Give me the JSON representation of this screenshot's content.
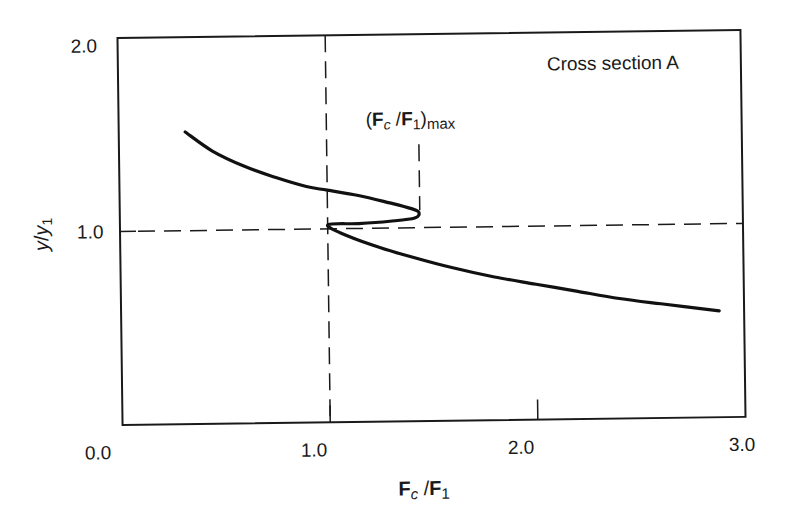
{
  "chart_data": {
    "type": "line",
    "title": "",
    "annotation_box": "Cross section A",
    "xlabel": "Fc/F1",
    "ylabel": "y/y1",
    "xlim": [
      0.0,
      3.0
    ],
    "ylim": [
      0.0,
      2.0
    ],
    "xticks": [
      "0.0",
      "1.0",
      "2.0",
      "3.0"
    ],
    "yticks": [
      "0.0",
      "1.0",
      "2.0"
    ],
    "grid": false,
    "legend": null,
    "reference_lines": [
      {
        "orientation": "vertical",
        "x": 1.0,
        "style": "dashed"
      },
      {
        "orientation": "horizontal",
        "y": 1.0,
        "style": "dashed"
      },
      {
        "orientation": "vertical",
        "x": 1.44,
        "y_from": 1.08,
        "y_to": 1.42,
        "style": "dashed",
        "label": "(Fc/F1)max"
      }
    ],
    "annotations": [
      {
        "text": "(Fc/F1)max",
        "x": 1.44,
        "y": 1.5
      }
    ],
    "series": [
      {
        "name": "Cross section A",
        "points": [
          [
            0.32,
            1.51
          ],
          [
            0.45,
            1.41
          ],
          [
            0.6,
            1.33
          ],
          [
            0.75,
            1.27
          ],
          [
            0.9,
            1.22
          ],
          [
            1.0,
            1.2
          ],
          [
            1.15,
            1.17
          ],
          [
            1.3,
            1.13
          ],
          [
            1.4,
            1.1
          ],
          [
            1.44,
            1.08
          ],
          [
            1.42,
            1.05
          ],
          [
            1.3,
            1.035
          ],
          [
            1.15,
            1.025
          ],
          [
            1.0,
            1.02
          ],
          [
            1.1,
            0.96
          ],
          [
            1.25,
            0.9
          ],
          [
            1.4,
            0.85
          ],
          [
            1.6,
            0.79
          ],
          [
            1.8,
            0.74
          ],
          [
            2.0,
            0.7
          ],
          [
            2.2,
            0.66
          ],
          [
            2.4,
            0.62
          ],
          [
            2.6,
            0.59
          ],
          [
            2.88,
            0.55
          ]
        ]
      }
    ]
  },
  "labels": {
    "box": "Cross section A",
    "anno_open": "(",
    "anno_F1": "F",
    "anno_c": "c",
    "anno_slash": " /",
    "anno_F2": "F",
    "anno_1": "1",
    "anno_close": ")",
    "anno_max": "max",
    "x_F1": "F",
    "x_c": "c",
    "x_slash": " /",
    "x_F2": "F",
    "x_1": "1",
    "y_y1": "y",
    "y_slash": "/",
    "y_y2": "y",
    "y_1": "1",
    "xt0": "0.0",
    "xt1": "1.0",
    "xt2": "2.0",
    "xt3": "3.0",
    "yt0": "2.0",
    "yt1": "1.0"
  }
}
